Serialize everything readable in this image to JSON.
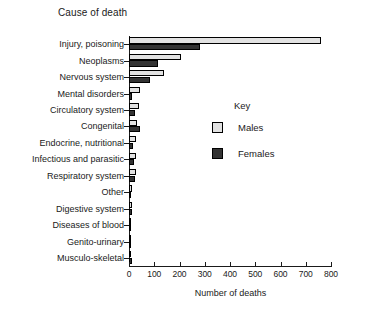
{
  "chart_data": {
    "type": "bar",
    "orientation": "horizontal",
    "title": "Cause of death",
    "xlabel": "Number of deaths",
    "ylabel": "",
    "xlim": [
      0,
      800
    ],
    "xticks": [
      0,
      100,
      200,
      300,
      400,
      500,
      600,
      700,
      800
    ],
    "xtick_labels": [
      "0",
      "100",
      "200",
      "300",
      "400",
      "500",
      "600",
      "700",
      "800"
    ],
    "grid": false,
    "legend_title": "Key",
    "legend_position": "inside-right",
    "categories": [
      "Injury, poisoning",
      "Neoplasms",
      "Nervous system",
      "Mental disorders",
      "Circulatory system",
      "Congenital",
      "Endocrine, nutritional",
      "Infectious and parasitic",
      "Respiratory system",
      "Other",
      "Digestive system",
      "Diseases of blood",
      "Genito-urinary",
      "Musculo-skeletal"
    ],
    "series": [
      {
        "name": "Males",
        "color": "#e2e2e2",
        "values": [
          760,
          205,
          140,
          45,
          40,
          30,
          28,
          27,
          28,
          12,
          12,
          5,
          5,
          4
        ]
      },
      {
        "name": "Females",
        "color": "#333333",
        "values": [
          280,
          115,
          85,
          10,
          22,
          42,
          16,
          20,
          22,
          8,
          10,
          4,
          4,
          12
        ]
      }
    ]
  },
  "legend": {
    "title": "Key",
    "entries": [
      {
        "label": "Males",
        "color": "#e2e2e2"
      },
      {
        "label": "Females",
        "color": "#333333"
      }
    ]
  },
  "axis": {
    "x_title": "Number of deaths"
  }
}
